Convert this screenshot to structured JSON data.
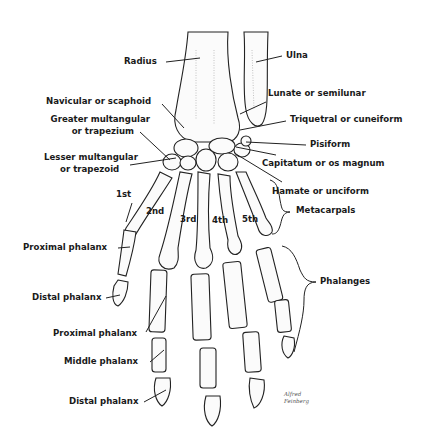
{
  "figure": {
    "signature": [
      "Alfred",
      "Feinberg"
    ]
  },
  "labels": {
    "radius": "Radius",
    "ulna": "Ulna",
    "navicular": "Navicular or scaphoid",
    "lunate": "Lunate or semilunar",
    "greater_mult_1": "Greater multangular",
    "greater_mult_2": "or trapezium",
    "triquetral": "Triquetral or cuneiform",
    "pisiform": "Pisiform",
    "lesser_mult_1": "Lesser multangular",
    "lesser_mult_2": "or trapezoid",
    "capitatum": "Capitatum or os magnum",
    "hamate": "Hamate or unciform",
    "metacarpals": "Metacarpals",
    "digit_1": "1st",
    "digit_2": "2nd",
    "digit_3": "3rd",
    "digit_4": "4th",
    "digit_5": "5th",
    "thumb_proximal": "Proximal phalanx",
    "thumb_distal": "Distal phalanx",
    "phalanges": "Phalanges",
    "finger_proximal": "Proximal phalanx",
    "finger_middle": "Middle phalanx",
    "finger_distal": "Distal phalanx"
  }
}
